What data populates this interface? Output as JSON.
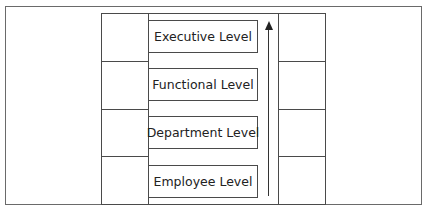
{
  "diagram": {
    "type": "hierarchy-levels",
    "levels": [
      {
        "label": "Executive Level"
      },
      {
        "label": "Functional Level"
      },
      {
        "label": "Department Level"
      },
      {
        "label": "Employee Level"
      }
    ],
    "arrow": {
      "direction": "up",
      "meaning": "progression from Employee Level to Executive Level"
    }
  }
}
